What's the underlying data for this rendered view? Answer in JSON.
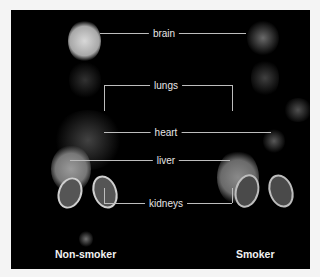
{
  "figure": {
    "organ_labels": [
      "brain",
      "lungs",
      "heart",
      "liver",
      "kidneys"
    ],
    "subjects": [
      "Non-smoker",
      "Smoker"
    ],
    "colors": {
      "background": "#000000",
      "page": "#f4f4f4",
      "label_text": "#e6e6e6",
      "leader_line": "#bdbdbd"
    }
  }
}
